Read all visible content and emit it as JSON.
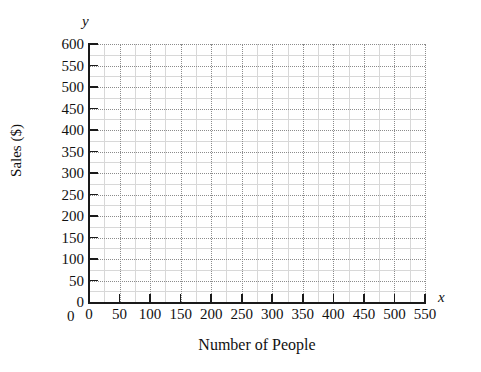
{
  "chart_data": {
    "type": "scatter",
    "title": "",
    "subtitle": "",
    "xlabel": "Number of People",
    "ylabel": "Sales ($)",
    "x_axis_letter": "x",
    "y_axis_letter": "y",
    "xlim": [
      0,
      550
    ],
    "ylim": [
      0,
      600
    ],
    "x_tick_step": 50,
    "y_tick_step": 50,
    "x_minor_step": 25,
    "y_minor_step": 25,
    "x_ticks": [
      0,
      50,
      100,
      150,
      200,
      250,
      300,
      350,
      400,
      450,
      500,
      550
    ],
    "y_ticks": [
      0,
      50,
      100,
      150,
      200,
      250,
      300,
      350,
      400,
      450,
      500,
      550,
      600
    ],
    "x_tick_labels": [
      "0",
      "50",
      "100",
      "150",
      "200",
      "250",
      "300",
      "350",
      "400",
      "450",
      "500",
      "550"
    ],
    "y_tick_labels": [
      "0",
      "50",
      "100",
      "150",
      "200",
      "250",
      "300",
      "350",
      "400",
      "450",
      "500",
      "550",
      "600"
    ],
    "origin_label_x": "0",
    "grid": true,
    "grid_major_style": "dotted",
    "grid_minor_style": "solid",
    "legend": null,
    "series": [],
    "values": [],
    "annotations": [],
    "colors": {
      "background": "#ffffff",
      "axis": "#1a1a1a",
      "grid_major": "#8c8c8c",
      "grid_minor": "#d8d8d8",
      "text": "#111111"
    }
  }
}
